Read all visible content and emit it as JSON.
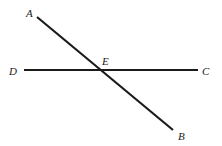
{
  "diagram": {
    "type": "intersecting-lines",
    "points": {
      "A": {
        "label": "A",
        "x": 37,
        "y": 17,
        "lx": 26,
        "ly": 17
      },
      "B": {
        "label": "B",
        "x": 173,
        "y": 130,
        "lx": 178,
        "ly": 140
      },
      "C": {
        "label": "C",
        "x": 198,
        "y": 70,
        "lx": 202,
        "ly": 75
      },
      "D": {
        "label": "D",
        "x": 24,
        "y": 70,
        "lx": 9,
        "ly": 75
      },
      "E": {
        "label": "E",
        "x": 103,
        "y": 70,
        "lx": 102,
        "ly": 65
      }
    },
    "segments": [
      {
        "name": "AB",
        "from": "A",
        "to": "B"
      },
      {
        "name": "DC",
        "from": "D",
        "to": "C"
      }
    ],
    "line_color": "#1a1a1a"
  }
}
